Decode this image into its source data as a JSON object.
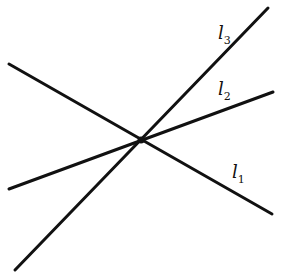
{
  "diagram": {
    "type": "intersecting-lines",
    "intersection_point": [
      141,
      140
    ],
    "stroke_color": "#111111",
    "lines": [
      {
        "id": "l1",
        "label_base": "l",
        "label_sub": "1",
        "x1": 9,
        "y1": 64,
        "x2": 272,
        "y2": 214,
        "label_pos": [
          232,
          163
        ]
      },
      {
        "id": "l2",
        "label_base": "l",
        "label_sub": "2",
        "x1": 9,
        "y1": 189,
        "x2": 273,
        "y2": 92,
        "label_pos": [
          218,
          80
        ]
      },
      {
        "id": "l3",
        "label_base": "l",
        "label_sub": "3",
        "x1": 15,
        "y1": 270,
        "x2": 268,
        "y2": 8,
        "label_pos": [
          218,
          24
        ]
      }
    ]
  }
}
